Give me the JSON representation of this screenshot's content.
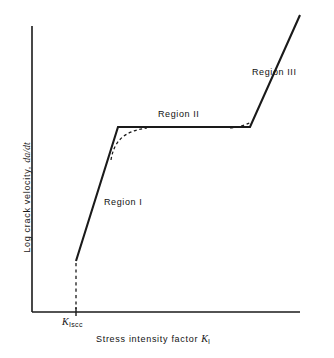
{
  "figure": {
    "background_color": "#ffffff",
    "line_color": "#1a1a1a",
    "axis_color": "#1a1a1a"
  },
  "axes": {
    "x_title_text": "Stress intensity factor ",
    "x_title_symbol": "K",
    "x_title_subscript": "I",
    "y_title_text": "Log crack velocity, ",
    "y_title_symbol": "da/dt",
    "x_tick_label_symbol": "K",
    "x_tick_label_subscript": "Iscc"
  },
  "annotations": {
    "region1": "Region I",
    "region2": "Region II",
    "region3": "Region III"
  },
  "chart_data": {
    "type": "line",
    "title": "",
    "xlabel": "Stress intensity factor K_I",
    "ylabel": "Log crack velocity, da/dt",
    "grid": false,
    "legend": "none",
    "axis_origin_px": [
      32,
      312
    ],
    "x_axis_end_px": [
      300,
      312
    ],
    "y_axis_top_px": [
      32,
      26
    ],
    "xlim": [
      0,
      1
    ],
    "ylim": [
      0,
      1
    ],
    "series": [
      {
        "name": "stress corrosion cracking curve",
        "style": "solid",
        "points_px": [
          [
            76,
            261
          ],
          [
            118,
            127
          ],
          [
            250,
            127
          ],
          [
            300,
            15
          ]
        ],
        "segments": [
          {
            "region": "Region I",
            "from_px": [
              76,
              261
            ],
            "to_px": [
              118,
              127
            ],
            "description": "steep rise above threshold"
          },
          {
            "region": "Region II",
            "from_px": [
              118,
              127
            ],
            "to_px": [
              250,
              127
            ],
            "description": "velocity plateau independent of K"
          },
          {
            "region": "Region III",
            "from_px": [
              250,
              127
            ],
            "to_px": [
              300,
              15
            ],
            "description": "rapid rise toward fracture toughness"
          }
        ]
      },
      {
        "name": "rounded transition I to II",
        "style": "dashed",
        "path_px": [
          [
            112,
            158
          ],
          [
            118,
            140
          ],
          [
            130,
            131
          ],
          [
            146,
            128
          ]
        ]
      },
      {
        "name": "rounded transition II to III",
        "style": "dashed",
        "path_px": [
          [
            232,
            128
          ],
          [
            243,
            126
          ],
          [
            250,
            124
          ]
        ]
      },
      {
        "name": "threshold reference line",
        "style": "dashed",
        "path_px": [
          [
            76,
            263
          ],
          [
            76,
            312
          ]
        ],
        "label": "K_Iscc"
      }
    ],
    "tick_marks": [
      {
        "label": "K_Iscc",
        "x_px": 76,
        "axis": "x"
      }
    ]
  }
}
